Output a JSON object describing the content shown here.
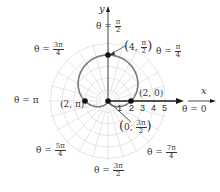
{
  "figure": {
    "axes": {
      "x_label": "x",
      "y_label": "y"
    },
    "ticks": [
      "1",
      "2",
      "3",
      "4",
      "5"
    ],
    "angle_labels": {
      "theta_0": {
        "prefix": "θ = ",
        "text": "0"
      },
      "theta_pi_4": {
        "prefix": "θ = ",
        "num": "π",
        "den": "4"
      },
      "theta_pi_2": {
        "prefix": "θ = ",
        "num": "π",
        "den": "2"
      },
      "theta_3pi_4": {
        "prefix": "θ = ",
        "num": "3π",
        "den": "4"
      },
      "theta_pi": {
        "prefix": "θ = ",
        "text": "π"
      },
      "theta_5pi_4": {
        "prefix": "θ = ",
        "num": "5π",
        "den": "4"
      },
      "theta_3pi_2": {
        "prefix": "θ = ",
        "num": "3π",
        "den": "2"
      },
      "theta_7pi_4": {
        "prefix": "θ = ",
        "num": "7π",
        "den": "4"
      }
    },
    "points": {
      "top": {
        "r": "4",
        "theta_num": "π",
        "theta_den": "2"
      },
      "right": {
        "label": "(2, 0)"
      },
      "left": {
        "label": "(2, π)"
      },
      "pole": {
        "r": "0",
        "theta_num": "3π",
        "theta_den": "2"
      }
    },
    "colors": {
      "curve": "#7a7a7a",
      "grid": "#dedede",
      "axis": "#1a1a1a",
      "point": "#111111"
    }
  },
  "chart_data": {
    "type": "polar",
    "equation": "r = 2 + 2 sin θ",
    "curve_shape": "cardioid",
    "grid": {
      "circles": [
        1,
        2,
        3,
        4,
        5
      ],
      "radial_step": "π/12"
    },
    "axis_ticks": [
      1,
      2,
      3,
      4,
      5
    ],
    "angle_labels": [
      "0",
      "π/4",
      "π/2",
      "3π/4",
      "π",
      "5π/4",
      "3π/2",
      "7π/4"
    ],
    "labeled_points": [
      {
        "r": 4,
        "theta": "π/2",
        "label": "(4, π/2)"
      },
      {
        "r": 2,
        "theta": "0",
        "label": "(2, 0)"
      },
      {
        "r": 2,
        "theta": "π",
        "label": "(2, π)"
      },
      {
        "r": 0,
        "theta": "3π/2",
        "label": "(0, 3π/2)"
      }
    ],
    "xlabel": "x",
    "ylabel": "y"
  }
}
